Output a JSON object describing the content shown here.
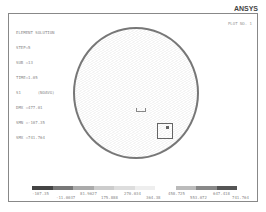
{
  "header": {
    "brand": "ANSYS",
    "plot_no": "PLOT NO.   1"
  },
  "info": {
    "lines": [
      "ELEMENT SOLUTION",
      "",
      "STEP=5",
      "SUB =13",
      "TIME=1.05",
      "S1       (NOAVG)",
      "DMX =477.01",
      "SMN =-107.35",
      "SMX =741.764"
    ]
  },
  "legend": {
    "colors": [
      "#444444",
      "#777777",
      "#aaaaaa",
      "#cccccc",
      "#dddddd",
      "#eeeeee",
      "#ffffff",
      "#bbbbbb",
      "#888888",
      "#555555"
    ],
    "labels": [
      "-107.35",
      "-11.0037",
      "81.9627",
      "175.888",
      "270.034",
      "364.38",
      "458.725",
      "553.072",
      "647.418",
      "741.764"
    ]
  }
}
